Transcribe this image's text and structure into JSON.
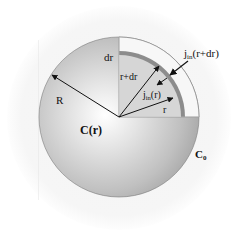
{
  "diagram": {
    "labels": {
      "dr": "dr",
      "r_plus_dr": "r+dr",
      "j_in_r_plus_dr_main": "j",
      "j_in_r_plus_dr_sub": "in",
      "j_in_r_plus_dr_arg": "(r+dr)",
      "j_in_r_main": "j",
      "j_in_r_sub": "in",
      "j_in_r_arg": "(r)",
      "r": "r",
      "R": "R",
      "C_r": "C(r)",
      "C0_main": "C",
      "C0_sub": "0"
    },
    "colors": {
      "halo": "#f3f3f3",
      "sphere_edge": "#a8a8a8",
      "sphere_center": "#ffffff",
      "quadrant_inner": "#d6d6d6",
      "quadrant_outer": "#f7f7f7",
      "shell_band": "#8c8c8c",
      "arrow": "#111111"
    }
  }
}
